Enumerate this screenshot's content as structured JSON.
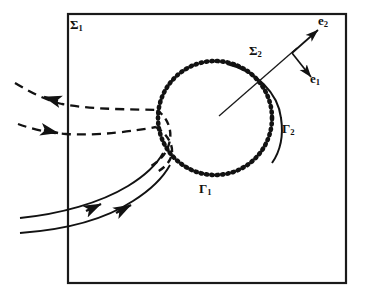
{
  "figure": {
    "domain_box": {
      "name": "outer-boundary-rectangle",
      "label": "Σ",
      "label_sub": "1",
      "x": 68,
      "y": 14,
      "w": 278,
      "h": 269,
      "stroke": "#1a1a1a",
      "stroke_width": 2.2
    },
    "labels": {
      "sigma1": {
        "base": "Σ",
        "sub": "1"
      },
      "sigma2": {
        "base": "Σ",
        "sub": "2"
      },
      "gamma1": {
        "base": "Γ",
        "sub": "1"
      },
      "gamma2": {
        "base": "Γ",
        "sub": "2"
      },
      "e1": {
        "base": "e",
        "sub": "1"
      },
      "e2": {
        "base": "e",
        "sub": "2"
      }
    },
    "dotted_circle": {
      "name": "gamma1-dotted-circle",
      "cx": 215,
      "cy": 118,
      "r": 57,
      "stroke": "#121212",
      "stroke_width": 4.6,
      "dash": "1.2 4.2"
    },
    "solid_arc": {
      "name": "gamma2-solid-arc",
      "path": "M 227 64 C 255 70 277 92 281 118 C 284 137 279 152 272 162",
      "stroke": "#121212",
      "stroke_width": 2.0
    },
    "sigma2_line": {
      "name": "sigma2-transversal-line",
      "x1": 219,
      "y1": 116,
      "x2": 297,
      "y2": 48,
      "stroke": "#1a1a1a",
      "stroke_width": 1.3
    },
    "basis_vectors": [
      {
        "name": "e2-basis-vector",
        "x1": 293,
        "y1": 52,
        "x2": 320,
        "y2": 28,
        "stroke": "#121212",
        "stroke_width": 1.6
      },
      {
        "name": "e1-basis-vector",
        "x1": 293,
        "y1": 52,
        "x2": 313,
        "y2": 79,
        "stroke": "#121212",
        "stroke_width": 1.6
      }
    ],
    "dashed_streamlines": [
      {
        "name": "dashed-streamline-upper",
        "path": "M 15 83 C 30 92 45 100 62 104 C 95 110 130 109 157 110",
        "arrow_at": {
          "x": 50,
          "y": 99,
          "angle": 205
        }
      },
      {
        "name": "dashed-streamline-lower",
        "path": "M 18 124 C 32 129 48 133 66 134 C 100 136 134 131 156 127",
        "arrow_at": {
          "x": 58,
          "y": 133,
          "angle": 190
        }
      }
    ],
    "dashed_cusp": {
      "name": "dashed-separatrix-cusp",
      "path": "M 157 110 C 167 118 172 130 168 143 C 165 154 157 161 150 165 M 156 127 C 166 133 172 143 171 152 C 170 161 163 167 156 171"
    },
    "solid_streamlines": [
      {
        "name": "solid-streamline-upper",
        "path": "M 20 218 C 60 214 100 203 128 186 C 146 175 157 163 163 153",
        "arrow_at": {
          "x": 98,
          "y": 205,
          "angle": 335
        }
      },
      {
        "name": "solid-streamline-lower",
        "path": "M 20 233 C 62 230 104 219 133 201 C 152 189 163 176 169 165",
        "arrow_at": {
          "x": 128,
          "y": 205,
          "angle": 328
        }
      }
    ],
    "colors": {
      "ink": "#121212",
      "background": "#ffffff"
    }
  }
}
